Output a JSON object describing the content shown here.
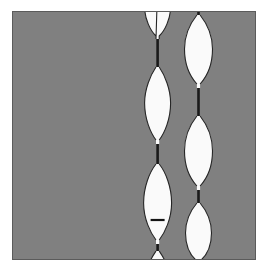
{
  "figure": {
    "kind": "micrograph",
    "panel": {
      "x": 12,
      "y": 11,
      "width": 244,
      "height": 249,
      "background_color": "#808080",
      "border_color": "#5b5b5b"
    },
    "canvas": {
      "width": 268,
      "height": 272,
      "background_color": "#ffffff"
    },
    "colors": {
      "background_gray": "#808080",
      "strand_fill": "#fafafa",
      "strand_outline": "#262626",
      "neck_dark": "#1a1a1a",
      "marker": "#141414",
      "frame": "#5b5b5b"
    },
    "strands": [
      {
        "name": "left-strand",
        "center_x": 157,
        "neck_width": 2.4,
        "bulges": [
          {
            "center_y": 2,
            "half_height": 24,
            "max_half_width": 13
          },
          {
            "center_y": 92,
            "half_height": 38,
            "max_half_width": 13
          },
          {
            "center_y": 192,
            "half_height": 40,
            "max_half_width": 14
          },
          {
            "center_y": 252,
            "half_height": 12,
            "max_half_width": 11
          }
        ],
        "neck_positions_y": [
          50,
          143,
          232
        ]
      },
      {
        "name": "right-strand",
        "center_x": 198,
        "neck_width": 2.4,
        "bulges": [
          {
            "center_y": 38,
            "half_height": 34,
            "max_half_width": 14
          },
          {
            "center_y": 140,
            "half_height": 35,
            "max_half_width": 14
          },
          {
            "center_y": 222,
            "half_height": 30,
            "max_half_width": 13
          }
        ],
        "neck_positions_y": [
          0,
          92,
          182,
          249
        ]
      }
    ],
    "marker": {
      "name": "scale-tick-marker",
      "shape": "horizontal-tick",
      "x": 157,
      "y": 220,
      "half_length": 7,
      "color": "#141414"
    }
  }
}
